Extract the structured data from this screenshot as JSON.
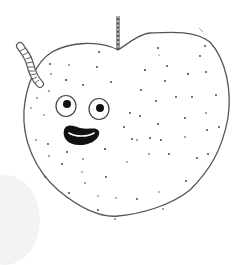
{
  "illustration": {
    "subject": "apple-with-worm",
    "colors": {
      "background": "#ffffff",
      "outline": "#444444",
      "speckle": "#333333",
      "face": "#111111",
      "shadow": "#f3f3f3"
    },
    "elements": [
      "apple-body",
      "stem",
      "worm",
      "left-eye",
      "right-eye",
      "smile",
      "speckles"
    ]
  }
}
